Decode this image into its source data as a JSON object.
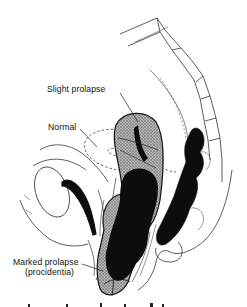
{
  "figure": {
    "style": "black-and-white medical line illustration",
    "colors": {
      "background": "#ffffff",
      "ink": "#111111",
      "uterus_fill_stippled": "#9a9a9a",
      "uterus_fill_dark": "#0d0d0d",
      "outline": "#222222"
    }
  },
  "labels": {
    "slight_prolapse": "Slight prolapse",
    "normal": "Normal",
    "marked_prolapse": "Marked prolapse",
    "marked_prolapse_sub": "(procidentia)"
  },
  "structures": [
    {
      "name": "sacrum-vertebral-column",
      "position": "upper right"
    },
    {
      "name": "rectum",
      "position": "right, dark"
    },
    {
      "name": "bladder",
      "position": "left, outlined"
    },
    {
      "name": "urethra",
      "position": "left, dark"
    },
    {
      "name": "uterus-normal",
      "position": "center, dashed outline"
    },
    {
      "name": "uterus-slight-prolapse",
      "position": "center, stippled"
    },
    {
      "name": "uterus-marked-prolapse",
      "position": "lower center, stippled and dark"
    }
  ]
}
